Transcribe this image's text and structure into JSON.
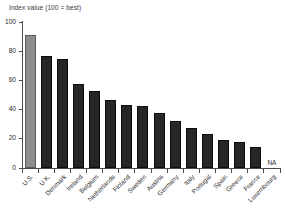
{
  "figure": {
    "title_clipped": "",
    "subtitle": "Index value (100 = best)",
    "na_label": "NA"
  },
  "colors": {
    "highlight_bar": "#8d8d8d",
    "bar": "#262626",
    "axis": "#4a4a4a",
    "text": "#2b2b2b",
    "background": "#ffffff"
  },
  "chart_data": {
    "type": "bar",
    "title": "",
    "subtitle": "Index value (100 = best)",
    "xlabel": "",
    "ylabel": "Index value (100 = best)",
    "ylim": [
      0,
      100
    ],
    "yticks": [
      0,
      20,
      40,
      60,
      80,
      100
    ],
    "ytick_labels": [
      "0",
      "20",
      "40",
      "60",
      "80",
      "100"
    ],
    "grid": false,
    "legend": "none",
    "highlight_category": "U.S.",
    "categories": [
      "U.S.",
      "U.K.",
      "Denmark",
      "Ireland",
      "Belgium",
      "Netherlands",
      "Finland",
      "Sweden",
      "Austria",
      "Germany",
      "Italy",
      "Portugal",
      "Spain",
      "Greece",
      "France",
      "Luxembourg"
    ],
    "values": [
      91,
      77,
      75,
      57.5,
      53,
      46.5,
      43.5,
      42.5,
      38,
      32,
      27.5,
      23.5,
      19,
      17.5,
      14.5,
      null
    ],
    "value_labels": [
      "",
      "",
      "",
      "",
      "",
      "",
      "",
      "",
      "",
      "",
      "",
      "",
      "",
      "",
      "",
      "NA"
    ]
  }
}
